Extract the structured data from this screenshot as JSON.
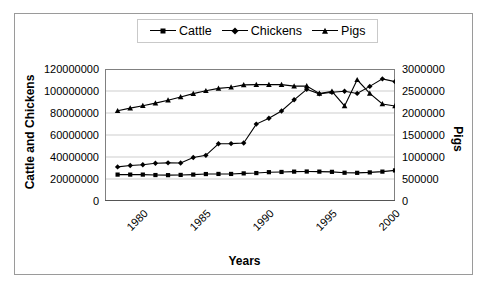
{
  "chart_data": {
    "type": "line",
    "title": "",
    "xlabel": "Years",
    "ylabel": "Cattle and Chickens",
    "ylabel_secondary": "Pigs",
    "grid": true,
    "legend_position": "top",
    "xlim": [
      1980,
      2003
    ],
    "ylim": [
      0,
      120000000
    ],
    "ylim_secondary": [
      0,
      3000000
    ],
    "yticks": [
      "0",
      "20000000",
      "40000000",
      "60000000",
      "80000000",
      "100000000",
      "120000000"
    ],
    "ytick_values": [
      0,
      20000000,
      40000000,
      60000000,
      80000000,
      100000000,
      120000000
    ],
    "yticks_secondary": [
      "0",
      "500000",
      "1000000",
      "1500000",
      "2000000",
      "2500000",
      "3000000"
    ],
    "ytick_values_secondary": [
      0,
      500000,
      1000000,
      1500000,
      2000000,
      2500000,
      3000000
    ],
    "xticks": [
      "1980",
      "1985",
      "1990",
      "1995",
      "2000"
    ],
    "xtick_values": [
      1980,
      1985,
      1990,
      1995,
      2000
    ],
    "x": [
      1981,
      1982,
      1983,
      1984,
      1985,
      1986,
      1987,
      1988,
      1989,
      1990,
      1991,
      1992,
      1993,
      1994,
      1995,
      1996,
      1997,
      1998,
      1999,
      2000,
      2001,
      2002,
      2003
    ],
    "series": [
      {
        "name": "Cattle",
        "axis": "left",
        "marker": "square",
        "values": [
          24000000,
          24000000,
          24000000,
          23600000,
          23500000,
          23700000,
          24000000,
          24500000,
          24600000,
          24600000,
          25100000,
          25400000,
          26200000,
          26400000,
          26700000,
          26800000,
          26700000,
          26500000,
          25700000,
          25600000,
          26000000,
          26700000,
          27800000
        ]
      },
      {
        "name": "Chickens",
        "axis": "left",
        "marker": "diamond",
        "values": [
          31000000,
          32300000,
          33000000,
          34300000,
          34700000,
          34600000,
          39600000,
          41500000,
          52000000,
          52200000,
          52700000,
          69900000,
          75200000,
          81800000,
          92000000,
          101500000,
          97400000,
          98900000,
          99800000,
          97800000,
          104200000,
          111000000,
          108500000
        ]
      },
      {
        "name": "Pigs",
        "axis": "right",
        "marker": "triangle",
        "values": [
          2050000,
          2110000,
          2165000,
          2225000,
          2290000,
          2365000,
          2440000,
          2505000,
          2560000,
          2585000,
          2640000,
          2645000,
          2645000,
          2645000,
          2610000,
          2615000,
          2445000,
          2490000,
          2160000,
          2755000,
          2445000,
          2205000,
          2160000
        ]
      }
    ]
  },
  "legend": {
    "entries": [
      {
        "label": "Cattle",
        "marker": "square"
      },
      {
        "label": "Chickens",
        "marker": "diamond"
      },
      {
        "label": "Pigs",
        "marker": "triangle"
      }
    ]
  },
  "colors": {
    "series": "#000000",
    "grid": "#c0c0c0",
    "axis": "#808080",
    "frame": "#9a9a9a",
    "background": "#ffffff"
  }
}
